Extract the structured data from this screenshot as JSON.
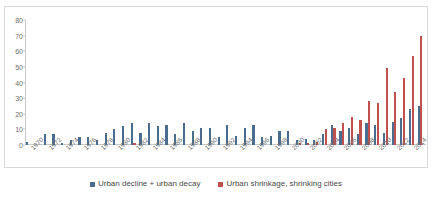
{
  "chart_data": {
    "type": "bar",
    "title": "",
    "subtitle": "",
    "xlabel": "",
    "ylabel": "",
    "ylim": [
      0,
      80
    ],
    "ytick_values": [
      0,
      10,
      20,
      30,
      40,
      50,
      60,
      70,
      80
    ],
    "ytick_labels": [
      "0",
      "10",
      "20",
      "30",
      "40",
      "50",
      "60",
      "70",
      "80"
    ],
    "grid": false,
    "legend_position": "bottom",
    "categories": [
      "1970",
      "1971",
      "1972",
      "1973",
      "1974",
      "1975",
      "1976",
      "1977",
      "1978",
      "1979",
      "1980",
      "1981",
      "1982",
      "1983",
      "1984",
      "1985",
      "1986",
      "1987",
      "1988",
      "1989",
      "1990",
      "1991",
      "1992",
      "1993",
      "1994",
      "1995",
      "1996",
      "1997",
      "1998",
      "1999",
      "2000",
      "2001",
      "2002",
      "2003",
      "2004",
      "2005",
      "2006",
      "2007",
      "2008",
      "2009",
      "2010",
      "2011",
      "2012",
      "2013",
      "2014",
      "2015"
    ],
    "xtick_labels": [
      "1970",
      "1972",
      "1974",
      "1976",
      "1978",
      "1980",
      "1982",
      "1984",
      "1986",
      "1988",
      "1990",
      "1992",
      "1994",
      "1996",
      "1998",
      "2000",
      "2002",
      "2004",
      "2006",
      "2008",
      "2010",
      "2012",
      "2014"
    ],
    "series": [
      {
        "name": "Urban decline + urban decay",
        "color": "#4a6c8f",
        "values": [
          2,
          0,
          7,
          7,
          1,
          3,
          5,
          5,
          3,
          8,
          10,
          12,
          14,
          8,
          14,
          12,
          13,
          7,
          14,
          9,
          11,
          11,
          5,
          13,
          6,
          11,
          13,
          5,
          6,
          9,
          9,
          3,
          4,
          3,
          7,
          13,
          9,
          11,
          7,
          14,
          13,
          8,
          15,
          17,
          23,
          25
        ]
      },
      {
        "name": "Urban shrinkage, shrinking cities",
        "color": "#c0504d",
        "values": [
          0,
          0,
          0,
          0,
          0,
          0,
          0,
          0,
          0,
          0,
          0,
          0,
          1,
          0,
          0,
          0,
          0,
          0,
          0,
          0,
          0,
          0,
          0,
          0,
          0,
          0,
          0,
          0,
          0,
          0,
          0,
          1,
          1,
          2,
          10,
          11,
          14,
          18,
          16,
          28,
          27,
          49,
          34,
          43,
          57,
          70
        ]
      }
    ]
  },
  "legend": {
    "items": [
      {
        "label": "Urban decline + urban decay",
        "color": "#4a6c8f"
      },
      {
        "label": "Urban shrinkage, shrinking cities",
        "color": "#c0504d"
      }
    ]
  }
}
